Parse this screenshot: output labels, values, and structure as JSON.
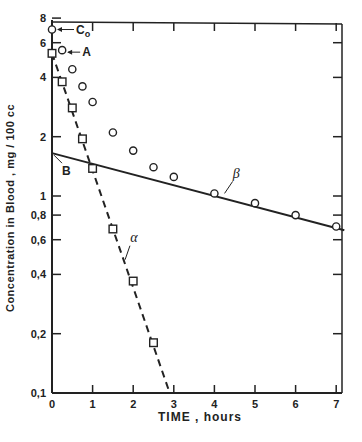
{
  "chart_data": {
    "type": "scatter",
    "title": "",
    "xlabel": "TIME , hours",
    "ylabel": "Concentration  in  Blood , mg / 100 cc",
    "xlim": [
      0,
      7.2
    ],
    "ylim": [
      0.1,
      8
    ],
    "yscale": "log",
    "grid": false,
    "x_ticks": [
      0,
      1,
      2,
      3,
      4,
      5,
      6,
      7
    ],
    "x_tick_labels": [
      "0",
      "1",
      "2",
      "3",
      "4",
      "5",
      "6",
      "7"
    ],
    "y_ticks": [
      0.1,
      0.2,
      0.4,
      0.6,
      0.8,
      1,
      2,
      4,
      6,
      8
    ],
    "y_tick_labels": [
      "0,1",
      "0,2",
      "0,4",
      "0,6",
      "0,8",
      "1",
      "2",
      "4",
      "6",
      "8"
    ],
    "series": [
      {
        "name": "Observed concentration",
        "marker": "circle",
        "x": [
          0,
          0.25,
          0.5,
          0.75,
          1.0,
          1.5,
          2.0,
          2.5,
          3.0,
          4.0,
          5.0,
          6.0,
          7.0
        ],
        "y": [
          7.0,
          5.5,
          4.4,
          3.6,
          3.0,
          2.1,
          1.7,
          1.4,
          1.25,
          1.03,
          0.92,
          0.8,
          0.7
        ]
      },
      {
        "name": "Residuals (distribution phase)",
        "marker": "square",
        "x": [
          0,
          0.25,
          0.5,
          0.75,
          1.0,
          1.5,
          2.0,
          2.5
        ],
        "y": [
          5.3,
          3.8,
          2.8,
          1.95,
          1.38,
          0.68,
          0.37,
          0.18
        ]
      },
      {
        "name": "alpha line (dashed)",
        "style": "dashed",
        "x": [
          0,
          2.9
        ],
        "y": [
          5.3,
          0.1
        ]
      },
      {
        "name": "beta line (solid)",
        "style": "solid",
        "x": [
          0,
          7.2
        ],
        "y": [
          1.65,
          0.67
        ]
      }
    ],
    "annotations": [
      {
        "text": "Co",
        "x": 0,
        "y": 7.0
      },
      {
        "text": "A",
        "x": 0,
        "y": 5.3
      },
      {
        "text": "B",
        "x": 0,
        "y": 1.65
      },
      {
        "text": "α",
        "x": 2.0,
        "y": 0.55
      },
      {
        "text": "β",
        "x": 4.5,
        "y": 1.15
      }
    ]
  },
  "labels": {
    "xlabel": "TIME , hours",
    "ylabel": "Concentration  in  Blood , mg / 100 cc",
    "co": "C",
    "co_sub": "o",
    "a": "A",
    "b": "B",
    "alpha": "α",
    "beta": "β"
  }
}
